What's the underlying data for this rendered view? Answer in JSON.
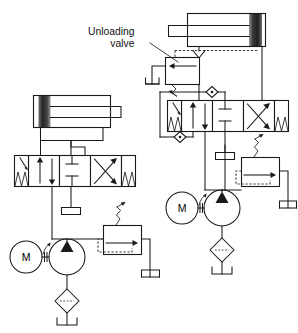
{
  "diagram": {
    "width": 298,
    "height": 333,
    "background_color": "#ffffff",
    "line_color": "#1a1a1a",
    "annotations": [
      {
        "name": "unloading-valve-label",
        "line1": "Unloading",
        "line2": "valve",
        "leader_from": [
          152,
          44
        ],
        "leader_to": [
          178,
          62
        ]
      }
    ]
  },
  "circuits": [
    {
      "name": "left-circuit",
      "components": {
        "cylinder": {
          "label": "double-acting-cylinder",
          "piston_side": "left",
          "rod_side": "right",
          "body": [
            33,
            95,
            77,
            32
          ],
          "piston": [
            38,
            96,
            12,
            30
          ],
          "rod": [
            50,
            106,
            70,
            11
          ]
        },
        "directional_valve": {
          "label": "4-way-3-position-directional-valve",
          "type": "4/3",
          "positions": 3,
          "center_type": "tandem-center",
          "actuation": "spring-spring",
          "box": [
            14,
            155,
            118,
            32
          ]
        },
        "pump": {
          "label": "fixed-displacement-pump",
          "center": [
            67,
            257
          ],
          "radius": 18
        },
        "motor": {
          "label": "electric-motor",
          "text": "M",
          "center": [
            26,
            257
          ],
          "radius": 16
        },
        "relief_valve": {
          "label": "pressure-relief-valve",
          "box": [
            103,
            225,
            38,
            30
          ]
        },
        "filter": {
          "label": "suction-filter",
          "center": [
            67,
            301
          ],
          "half": 12
        },
        "tank": {
          "label": "reservoir-tank",
          "points": [
            57,
            320,
            77,
            320
          ]
        }
      }
    },
    {
      "name": "right-circuit",
      "components": {
        "cylinder": {
          "label": "double-acting-cylinder",
          "piston_side": "right",
          "rod_side": "left",
          "body": [
            187,
            14,
            78,
            33
          ],
          "piston": [
            249,
            15,
            13,
            31
          ],
          "rod": [
            168,
            25,
            82,
            11
          ]
        },
        "unloading_valve": {
          "label": "unloading-valve",
          "box": [
            165,
            57,
            34,
            27
          ],
          "pilot": "external-dotted"
        },
        "directional_valve": {
          "label": "4-way-3-position-directional-valve",
          "type": "4/3",
          "positions": 3,
          "center_type": "tandem-center",
          "actuation": "spring-spring",
          "box": [
            167,
            100,
            124,
            32
          ]
        },
        "check_valve_upper": {
          "label": "check-valve",
          "center": [
            212,
            92
          ]
        },
        "check_valve_lower": {
          "label": "check-valve",
          "center": [
            180,
            137
          ]
        },
        "pump": {
          "label": "fixed-displacement-pump",
          "center": [
            222,
            208
          ],
          "radius": 18
        },
        "motor": {
          "label": "electric-motor",
          "text": "M",
          "center": [
            182,
            208
          ],
          "radius": 16
        },
        "relief_valve": {
          "label": "pressure-relief-valve",
          "box": [
            241,
            157,
            38,
            30
          ]
        },
        "filter": {
          "label": "suction-filter",
          "center": [
            222,
            250
          ],
          "half": 12
        },
        "tank": {
          "label": "reservoir-tank",
          "points": [
            212,
            269,
            232,
            269
          ]
        }
      }
    }
  ],
  "symbols": {
    "motor_letter": "M",
    "check_valve_icon": "check-valve-icon",
    "filter_icon": "filter-icon",
    "tank_icon": "tank-icon",
    "spring_icon": "spring-icon",
    "pump_icon": "pump-icon",
    "cylinder_icon": "cylinder-icon",
    "arrow_icon": "flow-arrow-icon"
  }
}
